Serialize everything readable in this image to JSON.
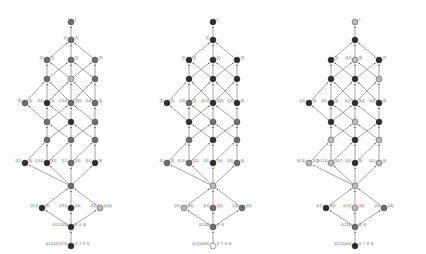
{
  "figure": {
    "type": "lattice-hasse-diagram-triptych",
    "panel_count": 3,
    "background": "#ffffff",
    "edge_color": "#3b3b3b",
    "node_stroke": "#2b2b2b",
    "shades": {
      "dark": "#2e2e2e",
      "mid": "#6e6e6e",
      "light": "#b9b9b9",
      "pale": "#d8d8d8",
      "white": "#f2f2f2"
    }
  },
  "layout": {
    "rows": [
      {
        "id": "r0",
        "y": 22,
        "xs": [
          71
        ],
        "note": "apex"
      },
      {
        "id": "r1",
        "y": 40,
        "xs": [
          71
        ]
      },
      {
        "id": "r2",
        "y": 60,
        "xs": [
          47,
          71,
          95
        ]
      },
      {
        "id": "r3",
        "y": 79,
        "xs": [
          47,
          71,
          95
        ]
      },
      {
        "id": "r4",
        "y": 103,
        "xs": [
          25,
          47,
          71,
          95
        ]
      },
      {
        "id": "r5",
        "y": 122,
        "xs": [
          47,
          71,
          95
        ]
      },
      {
        "id": "r6",
        "y": 140,
        "xs": [
          47,
          71,
          95
        ]
      },
      {
        "id": "r7",
        "y": 163,
        "xs": [
          25,
          47,
          71,
          95
        ]
      },
      {
        "id": "r8",
        "y": 186,
        "xs": [
          71
        ]
      },
      {
        "id": "r9",
        "y": 208,
        "xs": [
          42,
          71,
          100
        ]
      },
      {
        "id": "r10",
        "y": 227,
        "xs": [
          71
        ]
      },
      {
        "id": "r11",
        "y": 246,
        "xs": [
          71
        ]
      }
    ],
    "edges": [
      [
        "r1.0",
        "r0.0"
      ],
      [
        "r2.0",
        "r1.0"
      ],
      [
        "r2.1",
        "r1.0"
      ],
      [
        "r2.2",
        "r1.0"
      ],
      [
        "r3.0",
        "r2.0"
      ],
      [
        "r3.0",
        "r2.1"
      ],
      [
        "r3.1",
        "r2.0"
      ],
      [
        "r3.1",
        "r2.1"
      ],
      [
        "r3.1",
        "r2.2"
      ],
      [
        "r3.2",
        "r2.1"
      ],
      [
        "r3.2",
        "r2.2"
      ],
      [
        "r4.0",
        "r3.0"
      ],
      [
        "r4.1",
        "r3.0"
      ],
      [
        "r4.1",
        "r3.1"
      ],
      [
        "r4.2",
        "r3.0"
      ],
      [
        "r4.2",
        "r3.1"
      ],
      [
        "r4.2",
        "r3.2"
      ],
      [
        "r4.3",
        "r3.1"
      ],
      [
        "r4.3",
        "r3.2"
      ],
      [
        "r5.0",
        "r4.0"
      ],
      [
        "r5.0",
        "r4.1"
      ],
      [
        "r5.0",
        "r4.2"
      ],
      [
        "r5.1",
        "r4.1"
      ],
      [
        "r5.1",
        "r4.2"
      ],
      [
        "r5.2",
        "r4.2"
      ],
      [
        "r5.2",
        "r4.3"
      ],
      [
        "r6.0",
        "r5.0"
      ],
      [
        "r6.0",
        "r5.1"
      ],
      [
        "r6.1",
        "r5.0"
      ],
      [
        "r6.1",
        "r5.1"
      ],
      [
        "r6.1",
        "r5.2"
      ],
      [
        "r6.2",
        "r5.1"
      ],
      [
        "r6.2",
        "r5.2"
      ],
      [
        "r7.0",
        "r6.0"
      ],
      [
        "r7.1",
        "r6.0"
      ],
      [
        "r7.1",
        "r6.1"
      ],
      [
        "r7.2",
        "r6.1"
      ],
      [
        "r7.2",
        "r6.2"
      ],
      [
        "r7.3",
        "r6.2"
      ],
      [
        "r8.0",
        "r7.0"
      ],
      [
        "r8.0",
        "r7.1"
      ],
      [
        "r8.0",
        "r7.2"
      ],
      [
        "r8.0",
        "r7.3"
      ],
      [
        "r9.0",
        "r8.0"
      ],
      [
        "r9.1",
        "r8.0"
      ],
      [
        "r9.2",
        "r8.0"
      ],
      [
        "r10.0",
        "r9.0"
      ],
      [
        "r10.0",
        "r9.1"
      ],
      [
        "r10.0",
        "r9.2"
      ],
      [
        "r11.0",
        "r10.0"
      ]
    ]
  },
  "panels": [
    {
      "name": "panel-left",
      "x": 0,
      "shades": {
        "r0": [
          "mid"
        ],
        "r1": [
          "mid"
        ],
        "r2": [
          "mid",
          "mid",
          "mid"
        ],
        "r3": [
          "mid",
          "light",
          "mid"
        ],
        "r4": [
          "mid",
          "dark",
          "mid",
          "mid"
        ],
        "r5": [
          "mid",
          "dark",
          "mid"
        ],
        "r6": [
          "mid",
          "mid",
          "mid"
        ],
        "r7": [
          "dark",
          "dark",
          "mid",
          "dark"
        ],
        "r8": [
          "mid"
        ],
        "r9": [
          "dark",
          "dark",
          "light"
        ],
        "r10": [
          "dark"
        ],
        "r11": [
          "dark"
        ]
      },
      "labels": [
        {
          "node": "r0.0",
          "side": "r",
          "text": "1"
        },
        {
          "node": "r1.0",
          "side": "l",
          "text": "(1)"
        },
        {
          "node": "r1.0",
          "side": "r",
          "text": "(1)"
        },
        {
          "node": "r2.0",
          "side": "l",
          "text": "(1)"
        },
        {
          "node": "r2.0",
          "side": "r",
          "text": "(2)"
        },
        {
          "node": "r2.1",
          "side": "r",
          "text": "(2)"
        },
        {
          "node": "r2.2",
          "side": "r",
          "text": "(3)"
        },
        {
          "node": "r4.0",
          "side": "l",
          "text": "(3)"
        },
        {
          "node": "r4.0",
          "side": "r",
          "text": "(4)"
        },
        {
          "node": "r4.1",
          "side": "l",
          "text": "(1,4)"
        },
        {
          "node": "r4.1",
          "side": "r",
          "text": "(5)"
        },
        {
          "node": "r4.2",
          "side": "l",
          "text": "(1,3,4)"
        },
        {
          "node": "r4.2",
          "side": "r",
          "text": "(2)(5)"
        },
        {
          "node": "r4.3",
          "side": "l",
          "text": "(1,4)"
        },
        {
          "node": "r4.3",
          "side": "r",
          "text": "(6)"
        },
        {
          "node": "r7.0",
          "side": "l",
          "text": "(3,1)"
        },
        {
          "node": "r7.0",
          "side": "r",
          "text": "(4)"
        },
        {
          "node": "r7.1",
          "side": "l",
          "text": "(1,3,4)"
        },
        {
          "node": "r7.1",
          "side": "r",
          "text": "(4,5)"
        },
        {
          "node": "r7.2",
          "side": "l",
          "text": "(1,2)"
        },
        {
          "node": "r7.2",
          "side": "r",
          "text": "(5,6)"
        },
        {
          "node": "r7.3",
          "side": "l",
          "text": "(3,4)"
        },
        {
          "node": "r7.3",
          "side": "r",
          "text": "(6)"
        },
        {
          "node": "r9.0",
          "side": "l",
          "text": "(3,1,4)"
        },
        {
          "node": "r9.0",
          "side": "r",
          "text": "(4)"
        },
        {
          "node": "r9.1",
          "side": "l",
          "text": "(1,3,4)"
        },
        {
          "node": "r9.1",
          "side": "r",
          "text": "(5,6)"
        },
        {
          "node": "r9.2",
          "side": "l",
          "text": "(3,1)"
        },
        {
          "node": "r9.2",
          "side": "r",
          "text": "(2,4,5)"
        },
        {
          "node": "r10.0",
          "side": "l",
          "text": "(0,1,2,3,4,5)"
        },
        {
          "node": "r10.0",
          "side": "r",
          "text": "(5 : 6 : 9)"
        },
        {
          "node": "r11.0",
          "side": "l",
          "text": "(0,1,2,3,4,5,6,7,8)"
        },
        {
          "node": "r11.0",
          "side": "r",
          "text": "(5 : 7 : 8 : 9)"
        }
      ]
    },
    {
      "name": "panel-middle",
      "x": 142,
      "shades": {
        "r0": [
          "dark"
        ],
        "r1": [
          "dark"
        ],
        "r2": [
          "dark",
          "dark",
          "dark"
        ],
        "r3": [
          "dark",
          "dark",
          "dark"
        ],
        "r4": [
          "dark",
          "mid",
          "dark",
          "dark"
        ],
        "r5": [
          "dark",
          "mid",
          "mid"
        ],
        "r6": [
          "mid",
          "dark",
          "mid"
        ],
        "r7": [
          "mid",
          "mid",
          "dark",
          "mid"
        ],
        "r8": [
          "light"
        ],
        "r9": [
          "light",
          "mid",
          "mid"
        ],
        "r10": [
          "mid"
        ],
        "r11": [
          "white"
        ]
      },
      "labels": [
        {
          "node": "r0.0",
          "side": "r",
          "text": "1"
        },
        {
          "node": "r1.0",
          "side": "l",
          "text": "(1)"
        },
        {
          "node": "r2.0",
          "side": "l",
          "text": "(1)"
        },
        {
          "node": "r2.0",
          "side": "r",
          "text": "(2)"
        },
        {
          "node": "r2.1",
          "side": "r",
          "text": "(2)"
        },
        {
          "node": "r2.2",
          "side": "r",
          "text": "(3)"
        },
        {
          "node": "r4.0",
          "side": "l",
          "text": "(3)"
        },
        {
          "node": "r4.0",
          "side": "r",
          "text": "(5)"
        },
        {
          "node": "r4.1",
          "side": "l",
          "text": "(1,3)"
        },
        {
          "node": "r4.1",
          "side": "r",
          "text": "(5)"
        },
        {
          "node": "r4.2",
          "side": "l",
          "text": "(3,1,4)"
        },
        {
          "node": "r4.2",
          "side": "r",
          "text": "(2)(5)"
        },
        {
          "node": "r4.3",
          "side": "l",
          "text": "(1,4)"
        },
        {
          "node": "r4.3",
          "side": "r",
          "text": "(6)"
        },
        {
          "node": "r7.0",
          "side": "l",
          "text": "(3)"
        },
        {
          "node": "r7.0",
          "side": "r",
          "text": "(4)"
        },
        {
          "node": "r7.1",
          "side": "l",
          "text": "(3,1,4)"
        },
        {
          "node": "r7.1",
          "side": "r",
          "text": "(4,5)"
        },
        {
          "node": "r7.2",
          "side": "l",
          "text": "(3,1)"
        },
        {
          "node": "r7.2",
          "side": "r",
          "text": "(5,6)"
        },
        {
          "node": "r7.3",
          "side": "l",
          "text": "(4,5)"
        },
        {
          "node": "r7.3",
          "side": "r",
          "text": "(6)"
        },
        {
          "node": "r9.0",
          "side": "l",
          "text": "(0,1)"
        },
        {
          "node": "r9.0",
          "side": "r",
          "text": "(4,6)"
        },
        {
          "node": "r9.1",
          "side": "l",
          "text": "(0,1)"
        },
        {
          "node": "r9.1",
          "side": "r",
          "text": "(4,6)"
        },
        {
          "node": "r9.2",
          "side": "l",
          "text": "(0,1)"
        },
        {
          "node": "r9.2",
          "side": "r",
          "text": "(4,6)"
        },
        {
          "node": "r10.0",
          "side": "l",
          "text": "(0,2,3,4)"
        },
        {
          "node": "r10.0",
          "side": "r",
          "text": "(6 : 9)"
        },
        {
          "node": "r11.0",
          "side": "l",
          "text": "(0,1,3,4,6,8,9)"
        },
        {
          "node": "r11.0",
          "side": "r",
          "text": "(5 : 7 : 8 : 9)"
        }
      ]
    },
    {
      "name": "panel-right",
      "x": 284,
      "shades": {
        "r0": [
          "light"
        ],
        "r1": [
          "dark"
        ],
        "r2": [
          "dark",
          "light",
          "dark"
        ],
        "r3": [
          "dark",
          "dark",
          "light"
        ],
        "r4": [
          "dark",
          "dark",
          "dark",
          "dark"
        ],
        "r5": [
          "dark",
          "light",
          "dark"
        ],
        "r6": [
          "light",
          "dark",
          "light"
        ],
        "r7": [
          "light",
          "light",
          "dark",
          "light"
        ],
        "r8": [
          "light"
        ],
        "r9": [
          "dark",
          "light",
          "mid"
        ],
        "r10": [
          "mid"
        ],
        "r11": [
          "dark"
        ]
      },
      "labels": [
        {
          "node": "r0.0",
          "side": "r",
          "text": "1"
        },
        {
          "node": "r2.0",
          "side": "r",
          "text": "(4)"
        },
        {
          "node": "r2.1",
          "side": "l",
          "text": "(0,1)"
        },
        {
          "node": "r2.1",
          "side": "r",
          "text": "(6)"
        },
        {
          "node": "r2.2",
          "side": "r",
          "text": "(7)"
        },
        {
          "node": "r4.0",
          "side": "l",
          "text": "(0,4)"
        },
        {
          "node": "r4.0",
          "side": "r",
          "text": "(6)"
        },
        {
          "node": "r4.1",
          "side": "l",
          "text": "(0,1)"
        },
        {
          "node": "r4.1",
          "side": "r",
          "text": "(4)"
        },
        {
          "node": "r4.2",
          "side": "l",
          "text": "(4,1,)"
        },
        {
          "node": "r4.2",
          "side": "r",
          "text": "(6,4)"
        },
        {
          "node": "r4.3",
          "side": "l",
          "text": "(0,4)"
        },
        {
          "node": "r4.3",
          "side": "r",
          "text": "(6)"
        },
        {
          "node": "r7.0",
          "side": "l",
          "text": "(0,1,4)"
        },
        {
          "node": "r7.0",
          "side": "r",
          "text": "(4,7)"
        },
        {
          "node": "r7.1",
          "side": "l",
          "text": "(0,1,2,4)"
        },
        {
          "node": "r7.1",
          "side": "r",
          "text": "(4,6,7)"
        },
        {
          "node": "r7.2",
          "side": "l",
          "text": "(0,4)"
        },
        {
          "node": "r7.2",
          "side": "r",
          "text": "(6)"
        },
        {
          "node": "r7.3",
          "side": "l",
          "text": "(0,1)"
        },
        {
          "node": "r7.3",
          "side": "r",
          "text": "(6)"
        },
        {
          "node": "r9.0",
          "side": "l",
          "text": "(0,1)"
        },
        {
          "node": "r9.0",
          "side": "r",
          "text": "(4,6)"
        },
        {
          "node": "r9.1",
          "side": "l",
          "text": "(0,1,4)"
        },
        {
          "node": "r9.1",
          "side": "r",
          "text": "(4,6)"
        },
        {
          "node": "r9.2",
          "side": "l",
          "text": "(0,1)"
        },
        {
          "node": "r9.2",
          "side": "r",
          "text": "(4,6)"
        },
        {
          "node": "r10.0",
          "side": "l",
          "text": "(0,2,3,4)"
        },
        {
          "node": "r10.0",
          "side": "r",
          "text": "(6 : 8)"
        },
        {
          "node": "r11.0",
          "side": "l",
          "text": "(0,1,2,3,4,6,8)"
        },
        {
          "node": "r11.0",
          "side": "r",
          "text": "(5 : 7 : 8 : 9)"
        }
      ]
    }
  ]
}
